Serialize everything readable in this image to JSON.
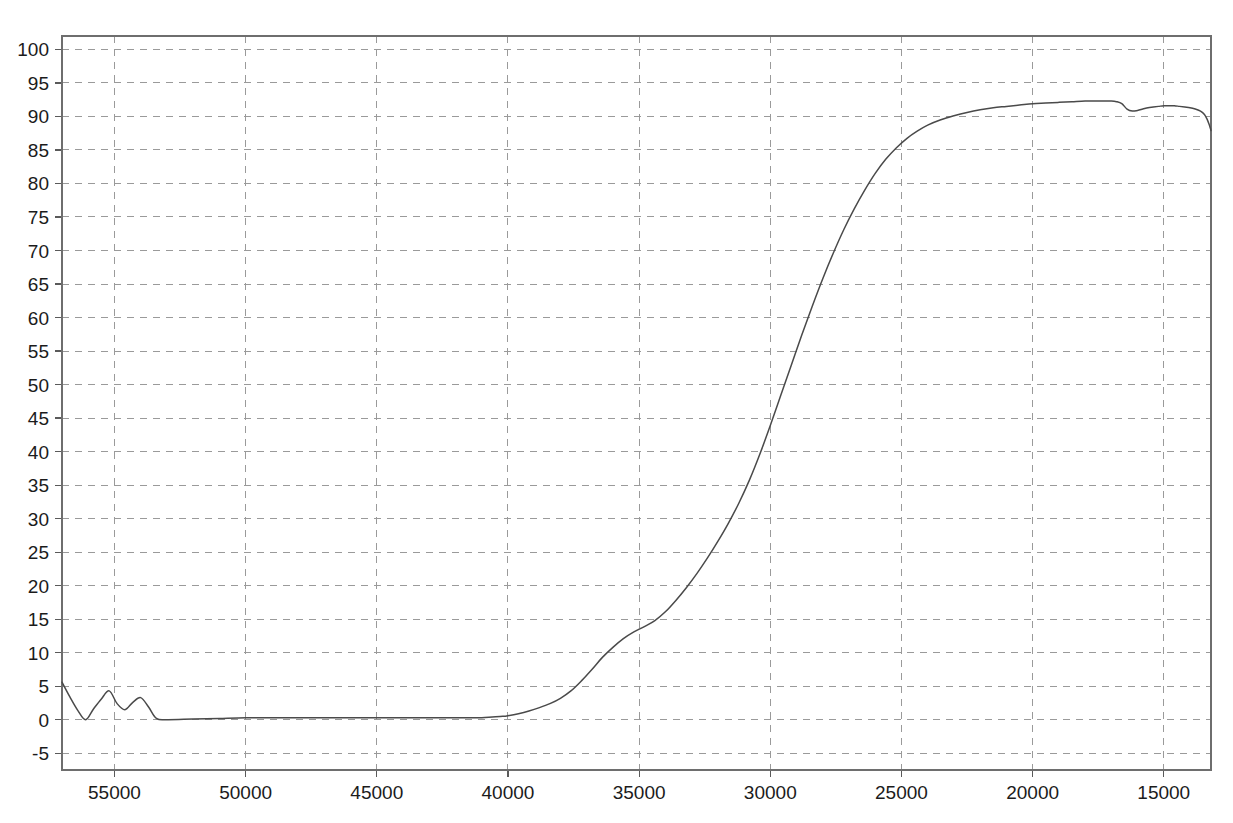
{
  "chart_data": {
    "type": "line",
    "title": "",
    "subtitle": "",
    "xlabel": "",
    "ylabel": "",
    "xlim": [
      57000,
      13200
    ],
    "ylim": [
      -7.5,
      102
    ],
    "x_ticks": [
      55000,
      50000,
      45000,
      40000,
      35000,
      30000,
      25000,
      20000,
      15000
    ],
    "x_tick_labels": [
      "55000",
      "50000",
      "45000",
      "40000",
      "35000",
      "30000",
      "25000",
      "20000",
      "15000"
    ],
    "y_ticks": [
      -5,
      0,
      5,
      10,
      15,
      20,
      25,
      30,
      35,
      40,
      45,
      50,
      55,
      60,
      65,
      70,
      75,
      80,
      85,
      90,
      95,
      100
    ],
    "y_tick_labels": [
      "-5",
      "0",
      "5",
      "10",
      "15",
      "20",
      "25",
      "30",
      "35",
      "40",
      "45",
      "50",
      "55",
      "60",
      "65",
      "70",
      "75",
      "80",
      "85",
      "90",
      "95",
      "100"
    ],
    "x_axis_reversed": true,
    "grid": true,
    "grid_style": "dashed",
    "legend": false,
    "legend_position": "none",
    "line_color": "#4a4a4a",
    "grid_color": "#9a9a9a",
    "axis_color": "#6e6e6e",
    "background_color": "#ffffff",
    "series": [
      {
        "name": "Transmittance",
        "x": [
          57000,
          56700,
          56400,
          56100,
          55800,
          55500,
          55200,
          54900,
          54600,
          54300,
          54000,
          53700,
          53400,
          53000,
          52000,
          51000,
          50000,
          49000,
          48000,
          47000,
          46000,
          45000,
          44000,
          43000,
          42000,
          41500,
          41000,
          40600,
          40200,
          40000,
          39600,
          39200,
          38800,
          38400,
          38000,
          37600,
          37200,
          36800,
          36400,
          36000,
          35600,
          35200,
          34800,
          34400,
          34000,
          33600,
          33200,
          32800,
          32400,
          32000,
          31600,
          31200,
          30800,
          30400,
          30000,
          29600,
          29200,
          28800,
          28400,
          28000,
          27600,
          27200,
          26800,
          26400,
          26000,
          25600,
          25200,
          24800,
          24400,
          24000,
          23500,
          23000,
          22500,
          22000,
          21500,
          21000,
          20500,
          20000,
          19500,
          19000,
          18500,
          18000,
          17500,
          17000,
          16800,
          16600,
          16400,
          16200,
          16000,
          15800,
          15600,
          15400,
          15200,
          15000,
          14800,
          14600,
          14400,
          14200,
          14000,
          13800,
          13600,
          13450,
          13350,
          13280,
          13230,
          13200
        ],
        "y": [
          5.6,
          3.4,
          1.4,
          0.0,
          1.6,
          3.1,
          4.3,
          2.4,
          1.5,
          2.6,
          3.3,
          1.9,
          0.2,
          0.0,
          0.1,
          0.2,
          0.3,
          0.3,
          0.3,
          0.3,
          0.3,
          0.3,
          0.3,
          0.3,
          0.3,
          0.3,
          0.3,
          0.4,
          0.5,
          0.6,
          0.9,
          1.3,
          1.8,
          2.4,
          3.2,
          4.3,
          5.8,
          7.5,
          9.3,
          10.8,
          12.1,
          13.1,
          13.9,
          14.8,
          16.1,
          17.8,
          19.7,
          21.8,
          24.1,
          26.6,
          29.3,
          32.3,
          35.7,
          39.6,
          43.9,
          48.4,
          52.9,
          57.4,
          61.7,
          65.8,
          69.6,
          73.1,
          76.2,
          79.0,
          81.5,
          83.6,
          85.3,
          86.7,
          87.8,
          88.7,
          89.5,
          90.1,
          90.6,
          91.0,
          91.3,
          91.5,
          91.7,
          91.9,
          92.0,
          92.1,
          92.2,
          92.3,
          92.3,
          92.3,
          92.2,
          91.9,
          91.1,
          90.8,
          90.9,
          91.1,
          91.3,
          91.4,
          91.5,
          91.6,
          91.6,
          91.6,
          91.5,
          91.4,
          91.3,
          91.1,
          90.8,
          90.3,
          89.6,
          88.9,
          88.3,
          87.9
        ]
      }
    ]
  },
  "axes": {
    "plot_left_px": 62,
    "plot_right_px": 1211,
    "plot_top_px": 36,
    "plot_bottom_px": 770
  }
}
